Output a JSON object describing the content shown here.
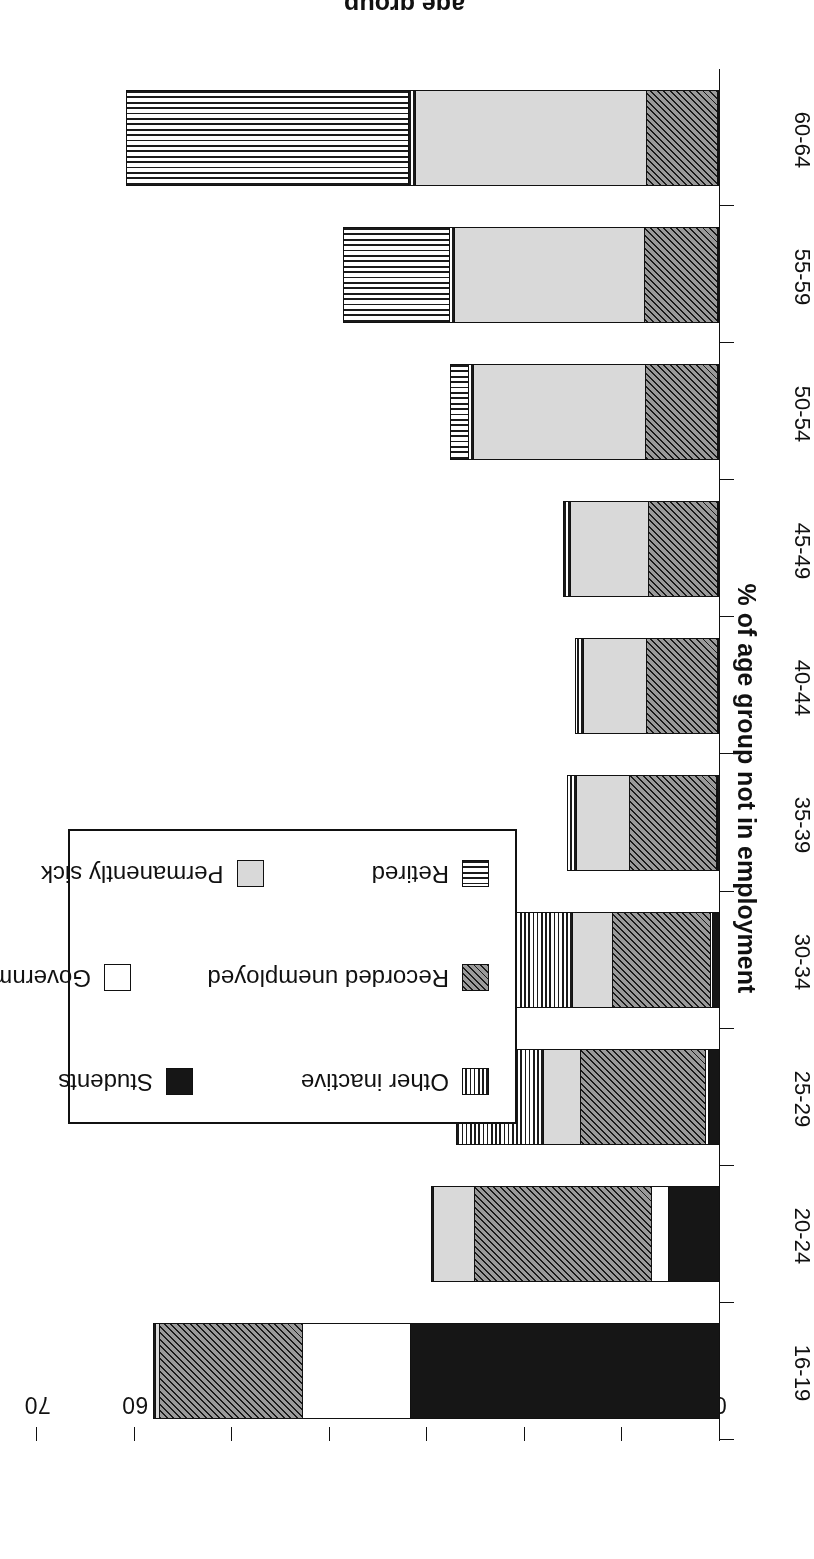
{
  "chart_data": {
    "type": "bar",
    "orientation": "horizontal-stacked",
    "title": "",
    "xlabel": "age group",
    "ylabel": "% of age group not in employment",
    "categories": [
      "16-19",
      "20-24",
      "25-29",
      "30-34",
      "35-39",
      "40-44",
      "45-49",
      "50-54",
      "55-59",
      "60-64"
    ],
    "ylim": [
      0,
      70
    ],
    "yticks": [
      0,
      10,
      20,
      30,
      40,
      50,
      60,
      70
    ],
    "grid": false,
    "legend_position": "upper-centre-inset",
    "stack_order": [
      "Students",
      "Government schemes",
      "Recorded unemployed",
      "Permanently sick",
      "Other inactive",
      "Retired"
    ],
    "series": [
      {
        "name": "Students",
        "key": "students",
        "fill": "solid-black",
        "values": [
          31.8,
          5.3,
          1.2,
          0.8,
          0.3,
          0.2,
          0.1,
          0.1,
          0.1,
          0.1
        ]
      },
      {
        "name": "Government schemes",
        "key": "gov",
        "fill": "white",
        "values": [
          11.2,
          1.9,
          0.4,
          0.3,
          0.2,
          0.2,
          0.2,
          0.2,
          0.2,
          0.2
        ]
      },
      {
        "name": "Recorded unemployed",
        "key": "unemp",
        "fill": "diagonal-hatch",
        "values": [
          14.7,
          18.2,
          13.0,
          10.2,
          9.0,
          7.4,
          7.2,
          7.5,
          7.6,
          7.4
        ]
      },
      {
        "name": "Permanently sick",
        "key": "sick",
        "fill": "light-grey",
        "values": [
          0.6,
          4.3,
          3.9,
          4.2,
          5.6,
          6.6,
          8.1,
          17.7,
          19.6,
          23.8
        ]
      },
      {
        "name": "Other inactive",
        "key": "other",
        "fill": "vertical-lines",
        "values": [
          0.3,
          0.4,
          9.0,
          10.4,
          1.0,
          0.9,
          0.8,
          0.6,
          0.6,
          0.8
        ]
      },
      {
        "name": "Retired",
        "key": "retired",
        "fill": "horizontal-lines",
        "values": [
          0.0,
          0.0,
          0.0,
          0.0,
          0.0,
          0.0,
          0.0,
          2.0,
          11.0,
          29.0
        ]
      }
    ],
    "totals": [
      58.6,
      30.1,
      27.5,
      25.9,
      16.1,
      15.3,
      16.4,
      28.1,
      39.1,
      61.3
    ]
  },
  "axes": {
    "x_title": "age group",
    "y_title": "% of age group not in employment",
    "y_tick_labels": [
      "0",
      "10",
      "20",
      "30",
      "40",
      "50",
      "60",
      "70"
    ],
    "category_labels": [
      "16-19",
      "20-24",
      "25-29",
      "30-34",
      "35-39",
      "40-44",
      "45-49",
      "50-54",
      "55-59",
      "60-64"
    ]
  },
  "legend": {
    "items": [
      {
        "label": "Other inactive",
        "fill": "vertical-lines"
      },
      {
        "label": "Students",
        "fill": "solid-black"
      },
      {
        "label": "Government schemes",
        "fill": "white"
      },
      {
        "label": "Recorded unemployed",
        "fill": "diagonal-hatch"
      },
      {
        "label": "Permanently sick",
        "fill": "light-grey"
      },
      {
        "label": "Retired",
        "fill": "horizontal-lines"
      }
    ]
  },
  "colors": {
    "ink": "#111111",
    "solid_black": "#161616",
    "light_grey": "#d9d9d9",
    "hatch_grey": "#9a9a9a",
    "paper": "#ffffff"
  }
}
